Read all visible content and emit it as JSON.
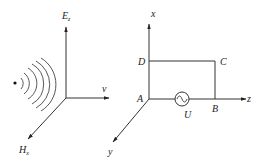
{
  "left_diagram": {
    "description": "Plane electromagnetic wave propagating from a point source",
    "axes": {
      "vertical": {
        "label": "E",
        "subscript": "z"
      },
      "horizontal": {
        "label": "v"
      },
      "diagonal": {
        "label": "H",
        "subscript": "x"
      }
    },
    "wavefront_arcs": 6,
    "source_dot": true
  },
  "right_diagram": {
    "description": "Rectangular loop ABCD with AC source U",
    "axes": {
      "vertical": {
        "label": "x"
      },
      "horizontal": {
        "label": "z"
      },
      "diagonal": {
        "label": "y"
      }
    },
    "points": {
      "A": "A",
      "B": "B",
      "C": "C",
      "D": "D"
    },
    "source": {
      "label": "U",
      "symbol": "ac-source"
    }
  }
}
